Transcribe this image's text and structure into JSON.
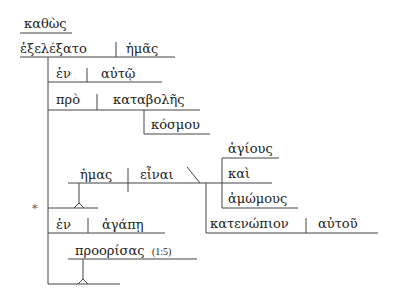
{
  "diagram": {
    "type": "Reed-Kellogg sentence diagram (Greek)",
    "conjunction": "καθὼς",
    "main_clause": {
      "verb": "ἐξελέξατο",
      "object": "ἡμᾶς"
    },
    "modifiers": [
      {
        "preposition": "ἐν",
        "object": "αὐτῷ"
      },
      {
        "preposition": "πρὸ",
        "object": "καταβολῆς",
        "genitive": "κόσμου"
      }
    ],
    "infinitive_clause": {
      "subject": "ἡμας",
      "verb": "εἶναι",
      "compound_predicate": [
        "ἁγίους",
        "καὶ",
        "ἀμώμους"
      ],
      "modifier": {
        "preposition": "κατενώπιον",
        "object": "αὐτοῦ"
      }
    },
    "asterisk": "*",
    "prep_phrase_2": {
      "preposition": "ἐν",
      "object": "ἀγάπῃ"
    },
    "participle": {
      "word": "προορίσας",
      "reference": "(1:5)"
    }
  },
  "colors": {
    "line": "#444444",
    "text": "#222222",
    "background": "#ffffff"
  }
}
